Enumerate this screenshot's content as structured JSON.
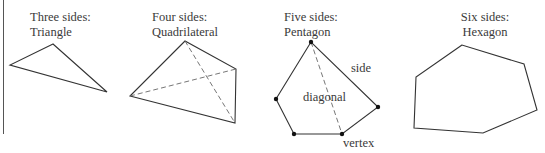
{
  "figure": {
    "panels": [
      {
        "id": "triangle",
        "line1": "Three sides:",
        "line2": "Triangle",
        "sides": 3
      },
      {
        "id": "quadrilateral",
        "line1": "Four sides:",
        "line2": "Quadrilateral",
        "sides": 4
      },
      {
        "id": "pentagon",
        "line1": "Five sides:",
        "line2": "Pentagon",
        "sides": 5
      },
      {
        "id": "hexagon",
        "line1": "Six sides:",
        "line2": "Hexagon",
        "sides": 6
      }
    ],
    "annotations": {
      "side": "side",
      "diagonal": "diagonal",
      "vertex": "vertex"
    },
    "colors": {
      "stroke": "#333333",
      "dashed": "#666666",
      "vertex_dot": "#111111"
    }
  }
}
